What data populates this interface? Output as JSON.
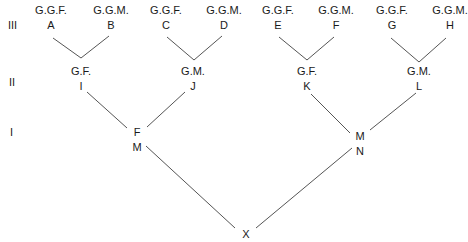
{
  "generations": [
    {
      "label": "III",
      "x": 8,
      "y": 19
    },
    {
      "label": "II",
      "x": 9,
      "y": 76
    },
    {
      "label": "I",
      "x": 10,
      "y": 126
    }
  ],
  "nodes": [
    {
      "id": "A",
      "role": "G.G.F.",
      "x": 51,
      "y": 4
    },
    {
      "id": "B",
      "role": "G.G.M.",
      "x": 111,
      "y": 4
    },
    {
      "id": "C",
      "role": "G.G.F.",
      "x": 166,
      "y": 4
    },
    {
      "id": "D",
      "role": "G.G.M.",
      "x": 224,
      "y": 4
    },
    {
      "id": "E",
      "role": "G.G.F.",
      "x": 278,
      "y": 4
    },
    {
      "id": "F",
      "role": "G.G.M.",
      "x": 336,
      "y": 4
    },
    {
      "id": "G",
      "role": "G.G.F.",
      "x": 392,
      "y": 4
    },
    {
      "id": "H",
      "role": "G.G.M.",
      "x": 450,
      "y": 4
    },
    {
      "id": "I",
      "role": "G.F.",
      "x": 81,
      "y": 65
    },
    {
      "id": "J",
      "role": "G.M.",
      "x": 193,
      "y": 65
    },
    {
      "id": "K",
      "role": "G.F.",
      "x": 307,
      "y": 65
    },
    {
      "id": "L",
      "role": "G.M.",
      "x": 419,
      "y": 65
    },
    {
      "id": "M",
      "role": "F",
      "x": 137,
      "y": 126
    },
    {
      "id": "N",
      "role": "M",
      "x": 360,
      "y": 130
    },
    {
      "id": "X",
      "role": "",
      "x": 246,
      "y": 228
    }
  ],
  "edges": [
    [
      53,
      38,
      81,
      58
    ],
    [
      109,
      36,
      81,
      58
    ],
    [
      167,
      37,
      194,
      60
    ],
    [
      222,
      36,
      194,
      60
    ],
    [
      279,
      37,
      307,
      60
    ],
    [
      334,
      37,
      307,
      60
    ],
    [
      391,
      38,
      419,
      62
    ],
    [
      446,
      38,
      419,
      62
    ],
    [
      87,
      92,
      127,
      128
    ],
    [
      185,
      92,
      147,
      127
    ],
    [
      311,
      94,
      350,
      133
    ],
    [
      416,
      93,
      370,
      130
    ],
    [
      146,
      146,
      235,
      228
    ],
    [
      352,
      148,
      256,
      228
    ]
  ],
  "colors": {
    "line": "#555555",
    "text": "#1a1a1a",
    "background": "#ffffff"
  }
}
